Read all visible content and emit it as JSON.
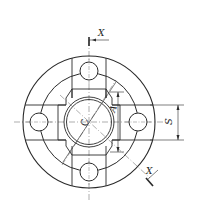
{
  "drawing": {
    "title": "Flange plan view with section X-X",
    "colors": {
      "line": "#2a2a2a",
      "thin": "#555555",
      "background": "#ffffff"
    },
    "labels": {
      "section_top": "X",
      "section_bottom": "X",
      "center": "C",
      "dim_a": "A",
      "dim_s": "S"
    }
  }
}
